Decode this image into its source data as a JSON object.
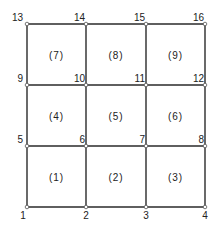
{
  "diagram": {
    "type": "finite-element-mesh",
    "grid": {
      "columns": 3,
      "rows": 3
    },
    "nodes": [
      {
        "id": "1",
        "col": 0,
        "row": 0,
        "label_pos": "below-left"
      },
      {
        "id": "2",
        "col": 1,
        "row": 0,
        "label_pos": "below"
      },
      {
        "id": "3",
        "col": 2,
        "row": 0,
        "label_pos": "below"
      },
      {
        "id": "4",
        "col": 3,
        "row": 0,
        "label_pos": "below"
      },
      {
        "id": "5",
        "col": 0,
        "row": 1,
        "label_pos": "above-left"
      },
      {
        "id": "6",
        "col": 1,
        "row": 1,
        "label_pos": "above-left-inner"
      },
      {
        "id": "7",
        "col": 2,
        "row": 1,
        "label_pos": "above-left-inner"
      },
      {
        "id": "8",
        "col": 3,
        "row": 1,
        "label_pos": "above-left-inner"
      },
      {
        "id": "9",
        "col": 0,
        "row": 2,
        "label_pos": "above-left"
      },
      {
        "id": "10",
        "col": 1,
        "row": 2,
        "label_pos": "above-left-inner"
      },
      {
        "id": "11",
        "col": 2,
        "row": 2,
        "label_pos": "above-left-inner"
      },
      {
        "id": "12",
        "col": 3,
        "row": 2,
        "label_pos": "above-left-inner"
      },
      {
        "id": "13",
        "col": 0,
        "row": 3,
        "label_pos": "above-left"
      },
      {
        "id": "14",
        "col": 1,
        "row": 3,
        "label_pos": "above-left-inner"
      },
      {
        "id": "15",
        "col": 2,
        "row": 3,
        "label_pos": "above-left-inner"
      },
      {
        "id": "16",
        "col": 3,
        "row": 3,
        "label_pos": "above-left-inner"
      }
    ],
    "elements": [
      {
        "label": "(1)",
        "col": 0,
        "row": 0
      },
      {
        "label": "(2)",
        "col": 1,
        "row": 0
      },
      {
        "label": "(3)",
        "col": 2,
        "row": 0
      },
      {
        "label": "(4)",
        "col": 0,
        "row": 1
      },
      {
        "label": "(5)",
        "col": 1,
        "row": 1
      },
      {
        "label": "(6)",
        "col": 2,
        "row": 1
      },
      {
        "label": "(7)",
        "col": 0,
        "row": 2
      },
      {
        "label": "(8)",
        "col": 1,
        "row": 2
      },
      {
        "label": "(9)",
        "col": 2,
        "row": 2
      }
    ],
    "colors": {
      "line": "#2a2a2a",
      "text": "#222222",
      "background": "#ffffff"
    }
  }
}
